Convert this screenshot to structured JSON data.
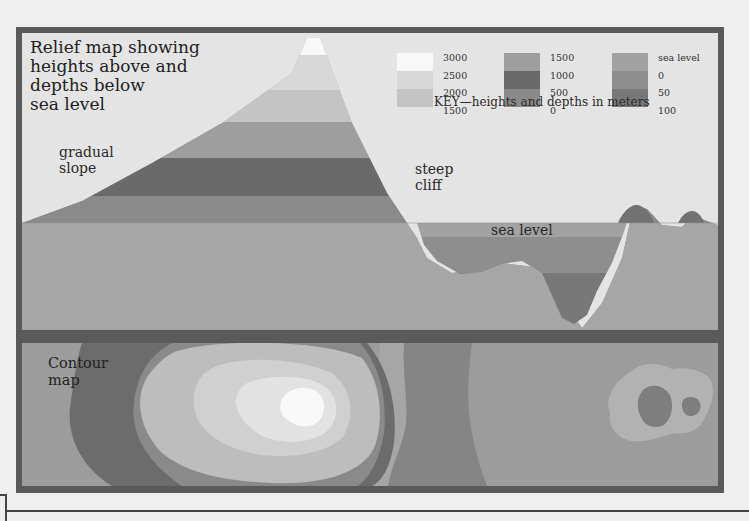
{
  "relief_map": {
    "title_lines": [
      "Relief map showing",
      "heights above and",
      "depths below",
      "sea level"
    ],
    "annotations": {
      "gradual_slope": [
        "gradual",
        "slope"
      ],
      "steep_cliff": [
        "steep",
        "cliff"
      ],
      "sea_level": "sea level"
    },
    "height_bands_m": [
      {
        "range": "2500-3000",
        "color": "#f8f8f8"
      },
      {
        "range": "2000-2500",
        "color": "#d6d6d6"
      },
      {
        "range": "1500-2000",
        "color": "#c2c2c2"
      },
      {
        "range": "1000-1500",
        "color": "#9e9e9e"
      },
      {
        "range": "500-1000",
        "color": "#6a6a6a"
      },
      {
        "range": "0-500",
        "color": "#8a8a8a"
      }
    ],
    "depth_bands_m": [
      {
        "range": "sea level-0",
        "color": "#a0a0a0"
      },
      {
        "range": "0-50",
        "color": "#8c8c8c"
      },
      {
        "range": "50-100",
        "color": "#777777"
      }
    ]
  },
  "key": {
    "caption": "KEY—heights and depths in meters",
    "groups": [
      {
        "values": [
          "3000",
          "2500",
          "2000",
          "1500"
        ],
        "colors": [
          "#f8f8f8",
          "#d8d8d8",
          "#c4c4c4"
        ]
      },
      {
        "values": [
          "1500",
          "1000",
          "500",
          "0"
        ],
        "colors": [
          "#9e9e9e",
          "#6a6a6a",
          "#8a8a8a"
        ]
      },
      {
        "values": [
          "sea level",
          "0",
          "50",
          "100"
        ],
        "colors": [
          "#a2a2a2",
          "#8e8e8e",
          "#787878"
        ]
      }
    ]
  },
  "contour_map": {
    "label_lines": [
      "Contour",
      "map"
    ]
  }
}
